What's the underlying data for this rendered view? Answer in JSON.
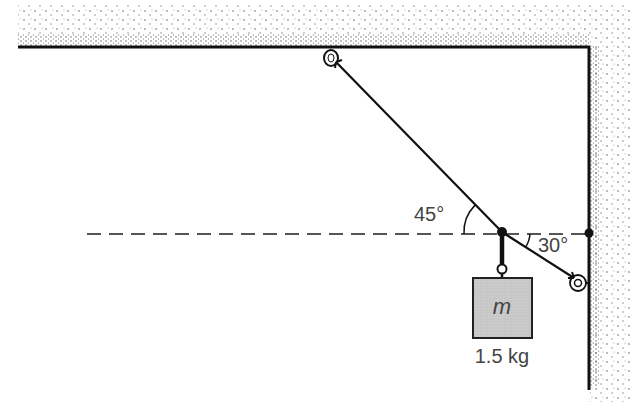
{
  "diagram": {
    "type": "physics-statics",
    "angles": {
      "ceiling_cable": {
        "label": "45°",
        "degrees": 45
      },
      "wall_cable": {
        "label": "30°",
        "degrees": 30
      }
    },
    "mass": {
      "symbol": "m",
      "label": "1.5 kg"
    },
    "colors": {
      "line": "#111111",
      "mass_fill": "#c9c9c9",
      "label": "#444444",
      "stipple": "#555555"
    }
  }
}
